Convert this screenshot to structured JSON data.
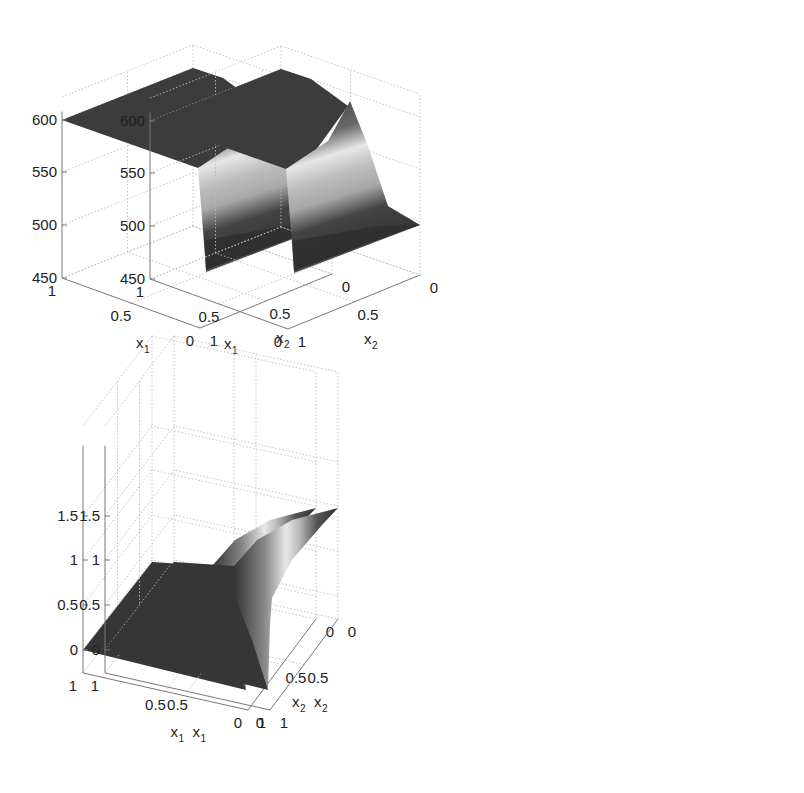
{
  "figure": {
    "panels": 4,
    "layout": "2x2"
  },
  "chart_data": [
    {
      "type": "surface",
      "position": "top-left",
      "xlabel": "x_1",
      "ylabel": "x_2",
      "zlabel": "",
      "x_ticks": [
        "1",
        "0.5",
        "0"
      ],
      "y_ticks": [
        "0",
        "0.5",
        "1"
      ],
      "z_ticks": [
        "450",
        "500",
        "550",
        "600"
      ],
      "xlim": [
        0,
        1
      ],
      "ylim": [
        0,
        1
      ],
      "zlim": [
        450,
        625
      ],
      "grid": true,
      "colormap": "gray",
      "surface_description": "Plateau near 600 for x1 from 0.4 to 1; steep sigmoid drop near x1≈0 down to about 455-500 across x2, with the lower shelf at the x1=0 edge",
      "key_points": [
        {
          "x1": 1,
          "x2": 1,
          "z": 600
        },
        {
          "x1": 1,
          "x2": 0,
          "z": 625
        },
        {
          "x1": 0,
          "x2": 1,
          "z": 555
        },
        {
          "x1": 0,
          "x2": 1,
          "z_low": 455
        },
        {
          "x1": 0,
          "x2": 0,
          "z": 500
        }
      ]
    },
    {
      "type": "surface",
      "position": "top-right",
      "xlabel": "x_1",
      "ylabel": "x_2",
      "zlabel": "",
      "x_ticks": [
        "1",
        "0.5",
        "0"
      ],
      "y_ticks": [
        "0",
        "0.5",
        "1"
      ],
      "z_ticks": [
        "450",
        "500",
        "550",
        "600"
      ],
      "xlim": [
        0,
        1
      ],
      "ylim": [
        0,
        1
      ],
      "zlim": [
        450,
        625
      ],
      "grid": true,
      "colormap": "gray",
      "surface_description": "Same shape as top-left: plateau near 600, sharp drop near x1≈0 to about 455-500",
      "key_points": [
        {
          "x1": 1,
          "x2": 1,
          "z": 600
        },
        {
          "x1": 1,
          "x2": 0,
          "z": 625
        },
        {
          "x1": 0,
          "x2": 1,
          "z": 555
        },
        {
          "x1": 0,
          "x2": 1,
          "z_low": 455
        },
        {
          "x1": 0,
          "x2": 0,
          "z": 500
        }
      ]
    },
    {
      "type": "surface",
      "position": "bottom-left",
      "xlabel": "x_1",
      "ylabel": "x_2",
      "zlabel": "",
      "x_ticks": [
        "1",
        "0.5",
        "0"
      ],
      "y_ticks": [
        "0",
        "0.5",
        "1"
      ],
      "z_ticks": [
        "0",
        "0.5",
        "1",
        "1.5"
      ],
      "xlim": [
        0,
        1
      ],
      "ylim": [
        0,
        1
      ],
      "zlim": [
        -0.25,
        2
      ],
      "grid": true,
      "colormap": "gray",
      "surface_description": "Flat at 0 for most of the domain; sharp rise near x1≈0 up to about 1.5 at x2=0",
      "key_points": [
        {
          "x1": 1,
          "x2": 1,
          "z": 0
        },
        {
          "x1": 1,
          "x2": 0,
          "z": 0
        },
        {
          "x1": 0,
          "x2": 1,
          "z": 0
        },
        {
          "x1": 0,
          "x2": 0,
          "z": 1.5
        }
      ]
    },
    {
      "type": "surface",
      "position": "bottom-right",
      "xlabel": "x_1",
      "ylabel": "x_2",
      "zlabel": "",
      "x_ticks": [
        "1",
        "0.5",
        "0"
      ],
      "y_ticks": [
        "0",
        "0.5",
        "1"
      ],
      "z_ticks": [
        "0",
        "0.5",
        "1",
        "1.5"
      ],
      "xlim": [
        0,
        1
      ],
      "ylim": [
        0,
        1
      ],
      "zlim": [
        -0.25,
        2
      ],
      "grid": true,
      "colormap": "gray",
      "surface_description": "Same shape as bottom-left: flat at 0 with a sharp rise near x1≈0 up to about 1.5 at x2=0",
      "key_points": [
        {
          "x1": 1,
          "x2": 1,
          "z": 0
        },
        {
          "x1": 1,
          "x2": 0,
          "z": 0
        },
        {
          "x1": 0,
          "x2": 1,
          "z": 0
        },
        {
          "x1": 0,
          "x2": 0,
          "z": 1.5
        }
      ]
    }
  ]
}
